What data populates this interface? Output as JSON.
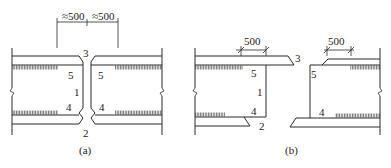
{
  "figure": {
    "panels": [
      {
        "id": "a",
        "caption": "(a)",
        "dimensions": [
          {
            "label": "≈500"
          },
          {
            "label": "≈500"
          }
        ],
        "labels": {
          "top_weld": "3",
          "bottom_weld": "2",
          "web": "1",
          "upper_left": "5",
          "upper_right": "5",
          "lower_left": "4",
          "lower_right": "4"
        }
      },
      {
        "id": "b",
        "caption": "(b)",
        "dimensions": [
          {
            "label": "500"
          },
          {
            "label": "500"
          }
        ],
        "labels": {
          "top_weld": "3",
          "bottom_weld": "2",
          "web": "1",
          "upper_left": "5",
          "lower_left": "4",
          "upper_right": "5",
          "lower_right": "4"
        }
      }
    ]
  }
}
